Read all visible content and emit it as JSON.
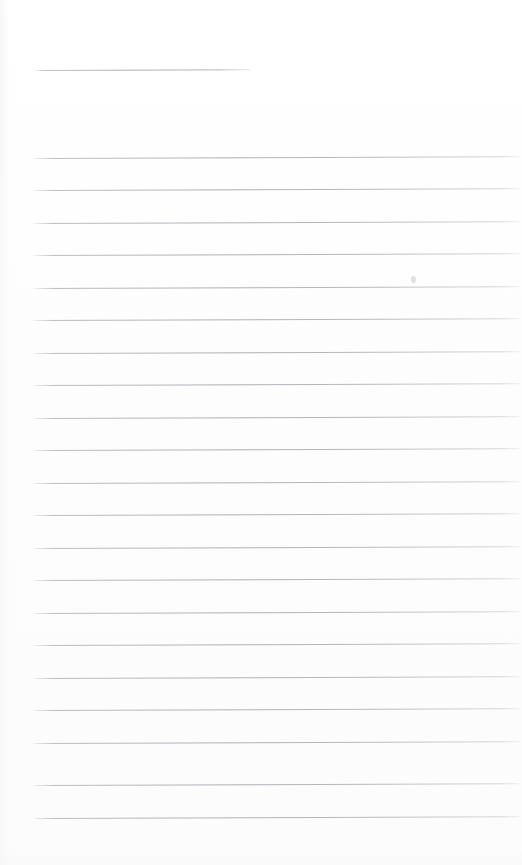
{
  "document": {
    "kind": "scanned-lined-paper",
    "title": "Blank ruled notebook page",
    "page_width": 522,
    "page_height": 865,
    "background_color": "#fefefe",
    "rule_color": "#a8abb1",
    "text_content": "",
    "handwriting_present": "none",
    "visible_text_items": []
  },
  "ruling": {
    "left_margin_x": 34,
    "right_edge_x": 520,
    "line_spacing_px": 33,
    "line_thickness_px": 1,
    "skew_degrees": -0.22,
    "header_rule": {
      "label": "header-rule",
      "x": 34,
      "y": 70,
      "width": 216
    },
    "body_rules": [
      {
        "y": 158,
        "x": 34,
        "width": 486
      },
      {
        "y": 190,
        "x": 34,
        "width": 486
      },
      {
        "y": 223,
        "x": 34,
        "width": 486
      },
      {
        "y": 255,
        "x": 34,
        "width": 486
      },
      {
        "y": 288,
        "x": 34,
        "width": 486
      },
      {
        "y": 320,
        "x": 34,
        "width": 486
      },
      {
        "y": 353,
        "x": 34,
        "width": 486
      },
      {
        "y": 385,
        "x": 34,
        "width": 486
      },
      {
        "y": 418,
        "x": 34,
        "width": 486
      },
      {
        "y": 450,
        "x": 34,
        "width": 486
      },
      {
        "y": 483,
        "x": 34,
        "width": 486
      },
      {
        "y": 515,
        "x": 34,
        "width": 486
      },
      {
        "y": 548,
        "x": 34,
        "width": 486
      },
      {
        "y": 580,
        "x": 34,
        "width": 486
      },
      {
        "y": 613,
        "x": 34,
        "width": 486
      },
      {
        "y": 645,
        "x": 34,
        "width": 486
      },
      {
        "y": 678,
        "x": 34,
        "width": 486
      },
      {
        "y": 710,
        "x": 34,
        "width": 486
      },
      {
        "y": 743,
        "x": 34,
        "width": 486
      },
      {
        "y": 785,
        "x": 34,
        "width": 486
      },
      {
        "y": 818,
        "x": 34,
        "width": 486
      }
    ]
  },
  "artifacts": {
    "speck": {
      "x": 411,
      "y": 276,
      "width": 5,
      "height": 7
    }
  }
}
